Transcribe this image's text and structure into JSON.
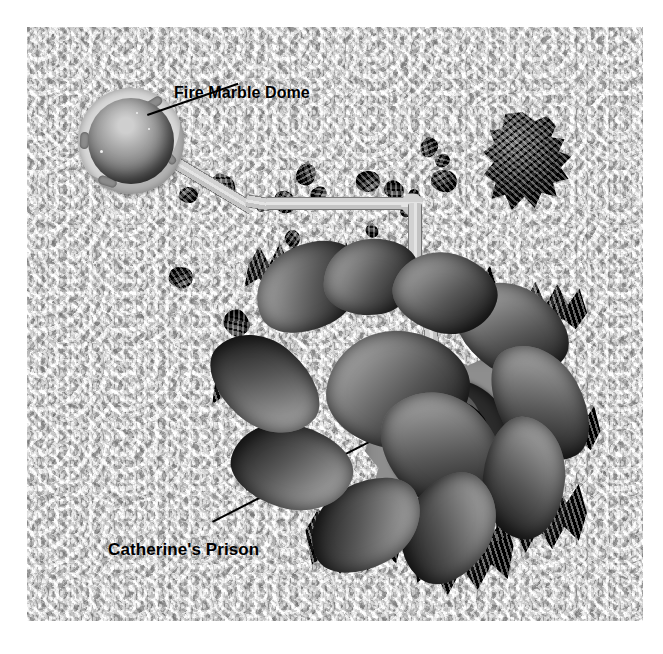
{
  "image": {
    "kind": "map-illustration",
    "palette": "grayscale",
    "canvas": {
      "width": 663,
      "height": 654
    },
    "plate": {
      "left": 27,
      "top": 27,
      "width": 616,
      "height": 594
    },
    "background_color": "#b9b9b9",
    "ink_color": "#000000"
  },
  "labels": {
    "fire_marble_dome": "Fire Marble Dome",
    "catherines_prison": "Catherine's Prison"
  },
  "features": {
    "dome": {
      "name": "Fire Marble Dome",
      "collar_color": "#d9d9d9",
      "sphere_color": "#7e7e7e",
      "center": {
        "x": 104,
        "y": 114
      },
      "radius": 53
    },
    "prison": {
      "name": "Catherine's Prison",
      "flange_color": "#8e8e8e",
      "ring_color": "#2c2c2c",
      "core_color": "#ffffff",
      "center": {
        "x": 422,
        "y": 414
      },
      "radius": 86
    },
    "walkway": {
      "name": "connecting walkway",
      "color": "#d2d2d2",
      "edge_color": "#6f6f6f"
    },
    "rock_island_ne": {
      "name": "craggy rock island",
      "color": "#2b2b2b"
    },
    "island_main": {
      "name": "central rock island",
      "color": "#262626"
    }
  },
  "pebbles": [
    {
      "x": 152,
      "y": 160,
      "w": 19,
      "h": 16,
      "r": "48% 52% 40% 60% / 55% 45% 58% 42%"
    },
    {
      "x": 183,
      "y": 148,
      "w": 26,
      "h": 22,
      "r": "52% 48% 60% 40% / 42% 58% 45% 55%"
    },
    {
      "x": 246,
      "y": 165,
      "w": 23,
      "h": 20,
      "r": "45% 55% 52% 48% / 60% 40% 55% 45%"
    },
    {
      "x": 268,
      "y": 138,
      "w": 22,
      "h": 19,
      "r": "55% 45% 48% 52% / 48% 52% 42% 58%"
    },
    {
      "x": 283,
      "y": 160,
      "w": 17,
      "h": 14,
      "r": "50% 50% 44% 56% / 52% 48% 56% 44%"
    },
    {
      "x": 329,
      "y": 144,
      "w": 24,
      "h": 21,
      "r": "48% 52% 56% 44% / 58% 42% 48% 52%"
    },
    {
      "x": 357,
      "y": 154,
      "w": 20,
      "h": 18,
      "r": "56% 44% 50% 50% / 45% 55% 52% 48%"
    },
    {
      "x": 380,
      "y": 163,
      "w": 14,
      "h": 12,
      "r": "50% 50% 50% 50% / 50% 50% 50% 50%"
    },
    {
      "x": 392,
      "y": 112,
      "w": 20,
      "h": 17,
      "r": "52% 48% 45% 55% / 55% 45% 50% 50%"
    },
    {
      "x": 408,
      "y": 127,
      "w": 15,
      "h": 13,
      "r": "46% 54% 55% 45% / 50% 50% 45% 55%"
    },
    {
      "x": 404,
      "y": 143,
      "w": 26,
      "h": 22,
      "r": "54% 46% 48% 52% / 46% 54% 52% 48%"
    },
    {
      "x": 338,
      "y": 198,
      "w": 14,
      "h": 12,
      "r": "50% 50% 48% 52% / 52% 48% 50% 50%"
    },
    {
      "x": 257,
      "y": 204,
      "w": 17,
      "h": 15,
      "r": "48% 52% 52% 48% / 50% 50% 48% 52%"
    },
    {
      "x": 262,
      "y": 220,
      "w": 13,
      "h": 11,
      "r": "50% 50% 50% 50% / 50% 50% 50% 50%"
    },
    {
      "x": 373,
      "y": 178,
      "w": 13,
      "h": 12,
      "r": "52% 48% 48% 52% / 48% 52% 52% 48%"
    },
    {
      "x": 142,
      "y": 240,
      "w": 24,
      "h": 21,
      "r": "46% 54% 58% 42% / 56% 44% 46% 54%"
    },
    {
      "x": 196,
      "y": 284,
      "w": 27,
      "h": 24,
      "r": "55% 45% 44% 56% / 44% 56% 55% 45%"
    },
    {
      "x": 228,
      "y": 174,
      "w": 12,
      "h": 10,
      "r": "50% 50% 50% 50% / 50% 50% 50% 50%"
    }
  ],
  "lobes": [
    {
      "x": 58,
      "y": 6,
      "w": 112,
      "h": 84,
      "rot": -26,
      "z": 3
    },
    {
      "x": 128,
      "y": 0,
      "w": 96,
      "h": 76,
      "rot": -6,
      "z": 3
    },
    {
      "x": 198,
      "y": 14,
      "w": 104,
      "h": 80,
      "rot": 16,
      "z": 3
    },
    {
      "x": 258,
      "y": 48,
      "w": 118,
      "h": 86,
      "rot": 34,
      "z": 2
    },
    {
      "x": 282,
      "y": 122,
      "w": 126,
      "h": 84,
      "rot": 62,
      "z": 2
    },
    {
      "x": 268,
      "y": 198,
      "w": 122,
      "h": 82,
      "rot": 96,
      "z": 2
    },
    {
      "x": 196,
      "y": 246,
      "w": 116,
      "h": 86,
      "rot": 124,
      "z": 2
    },
    {
      "x": 112,
      "y": 244,
      "w": 118,
      "h": 84,
      "rot": 152,
      "z": 2
    },
    {
      "x": 36,
      "y": 186,
      "w": 122,
      "h": 84,
      "rot": 196,
      "z": 2
    },
    {
      "x": 10,
      "y": 104,
      "w": 120,
      "h": 82,
      "rot": 222,
      "z": 2
    },
    {
      "x": 132,
      "y": 92,
      "w": 142,
      "h": 118,
      "rot": 8,
      "z": 1
    },
    {
      "x": 182,
      "y": 158,
      "w": 128,
      "h": 104,
      "rot": 46,
      "z": 1
    }
  ],
  "crags": [
    {
      "x": 44,
      "y": 2,
      "w": 92,
      "h": 62,
      "clip": "polygon(10% 40%, 22% 8%, 33% 38%, 44% 4%, 55% 36%, 66% 6%, 78% 34%, 90% 12%, 98% 48%, 86% 72%, 72% 56%, 60% 80%, 47% 58%, 34% 84%, 22% 60%, 6% 74%)"
    },
    {
      "x": 134,
      "y": 0,
      "w": 86,
      "h": 58,
      "clip": "polygon(8% 46%, 20% 6%, 31% 42%, 43% 2%, 54% 40%, 66% 8%, 77% 38%, 89% 14%, 97% 52%, 84% 76%, 70% 58%, 58% 82%, 45% 60%, 32% 86%, 20% 62%, 5% 78%)"
    },
    {
      "x": 216,
      "y": 16,
      "w": 90,
      "h": 60,
      "clip": "polygon(6% 52%, 18% 10%, 30% 46%, 42% 6%, 53% 44%, 65% 12%, 76% 42%, 88% 18%, 96% 56%, 83% 78%, 69% 60%, 57% 84%, 44% 62%, 31% 88%, 19% 64%, 4% 80%)"
    },
    {
      "x": 40,
      "y": 200,
      "w": 112,
      "h": 72,
      "clip": "polygon(4% 38%, 16% 4%, 27% 36%, 39% 2%, 50% 34%, 62% 6%, 73% 36%, 85% 10%, 95% 44%, 88% 70%, 74% 54%, 62% 78%, 49% 56%, 36% 82%, 24% 58%, 10% 72%)"
    },
    {
      "x": 104,
      "y": 268,
      "w": 108,
      "h": 78,
      "clip": "polygon(6% 30%, 18% 2%, 29% 32%, 41% 0%, 52% 30%, 64% 4%, 75% 32%, 87% 8%, 96% 40%, 90% 72%, 76% 56%, 64% 82%, 51% 58%, 38% 86%, 26% 60%, 12% 74%)"
    },
    {
      "x": 206,
      "y": 272,
      "w": 116,
      "h": 92,
      "clip": "polygon(8% 24%, 20% 0%, 31% 26%, 43% 2%, 54% 26%, 66% 0%, 77% 28%, 89% 6%, 97% 38%, 92% 74%, 78% 58%, 66% 86%, 53% 62%, 40% 92%, 28% 64%, 14% 78%)"
    },
    {
      "x": 300,
      "y": 40,
      "w": 96,
      "h": 68,
      "clip": "polygon(6% 42%, 18% 6%, 30% 40%, 42% 4%, 53% 38%, 65% 8%, 76% 38%, 88% 14%, 96% 50%, 84% 74%, 70% 58%, 58% 82%, 45% 60%, 32% 86%, 20% 62%, 4% 78%)"
    },
    {
      "x": 320,
      "y": 158,
      "w": 88,
      "h": 74,
      "clip": "polygon(8% 36%, 20% 4%, 32% 34%, 44% 2%, 55% 32%, 67% 6%, 78% 34%, 90% 12%, 97% 46%, 86% 72%, 72% 56%, 60% 80%, 47% 58%, 34% 84%, 22% 60%, 6% 74%)"
    },
    {
      "x": 294,
      "y": 238,
      "w": 102,
      "h": 86,
      "clip": "polygon(6% 30%, 18% 2%, 30% 30%, 42% 0%, 53% 30%, 65% 2%, 76% 30%, 88% 8%, 96% 42%, 88% 74%, 74% 58%, 62% 84%, 49% 60%, 36% 88%, 24% 62%, 8% 76%)"
    },
    {
      "x": 12,
      "y": 112,
      "w": 86,
      "h": 70,
      "clip": "polygon(10% 40%, 22% 6%, 34% 38%, 46% 4%, 57% 36%, 69% 8%, 80% 36%, 92% 14%, 98% 50%, 86% 74%, 72% 58%, 60% 82%, 47% 60%, 34% 86%, 22% 62%, 6% 76%)"
    }
  ]
}
